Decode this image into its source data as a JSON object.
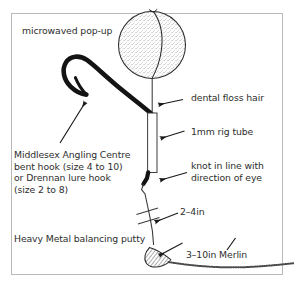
{
  "figure": {
    "type": "line-diagram",
    "border_color": "#b9b9b9",
    "ink_color": "#1a1a1a",
    "text_color": "#2e2e2e",
    "background": "#ffffff"
  },
  "labels": {
    "bait": "microwaved pop-up",
    "hair": "dental floss hair",
    "tube": "1mm rig tube",
    "knot_line1": "knot in line with",
    "knot_line2": "direction of eye",
    "hook_line1": "Middlesex Angling Centre",
    "hook_line2": "bent hook (size 4 to 10)",
    "hook_line3": "or Drennan lure hook",
    "hook_line4": "(size 2 to 8)",
    "gap": "2–4in",
    "putty": "Heavy Metal balancing putty",
    "hooklink": "3–10in Merlin"
  },
  "parts": [
    {
      "name": "microwaved pop-up",
      "shape": "stippled sphere"
    },
    {
      "name": "dental floss hair",
      "shape": "thin vertical line"
    },
    {
      "name": "1mm rig tube",
      "shape": "narrow white tube"
    },
    {
      "name": "bent hook",
      "shape": "thick black curved hook"
    },
    {
      "name": "knot",
      "shape": "line bend at hook eye"
    },
    {
      "name": "Heavy Metal balancing putty",
      "shape": "hatched teardrop blob"
    },
    {
      "name": "Merlin hooklink",
      "shape": "dotted braided line"
    }
  ],
  "annotations": [
    {
      "target": "microwaved pop-up",
      "arrow": "none"
    },
    {
      "target": "dental floss hair",
      "arrow": "left"
    },
    {
      "target": "1mm rig tube",
      "arrow": "left"
    },
    {
      "target": "knot",
      "arrow": "left"
    },
    {
      "target": "bent hook",
      "arrow": "up-right"
    },
    {
      "target": "2–4in",
      "arrow": "left"
    },
    {
      "target": "Heavy Metal balancing putty",
      "arrow": "up-right"
    },
    {
      "target": "3–10in Merlin",
      "arrow": "left"
    }
  ]
}
